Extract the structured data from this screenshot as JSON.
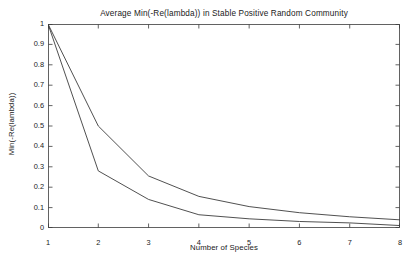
{
  "chart_data": {
    "type": "line",
    "title": "Average Min(-Re(lambda)) in Stable Positive Random Community",
    "xlabel": "Number of Species",
    "ylabel": "Min(-Re(lambda))",
    "xlim": [
      1,
      8
    ],
    "ylim": [
      0,
      1
    ],
    "grid": false,
    "legend": "none",
    "x": [
      1,
      2,
      3,
      4,
      5,
      6,
      7,
      8
    ],
    "xticks": [
      "1",
      "2",
      "3",
      "4",
      "5",
      "6",
      "7",
      "8"
    ],
    "yticks": [
      "0",
      "0.1",
      "0.2",
      "0.3",
      "0.4",
      "0.5",
      "0.6",
      "0.7",
      "0.8",
      "0.9",
      "1"
    ],
    "ytick_values": [
      0,
      0.1,
      0.2,
      0.3,
      0.4,
      0.5,
      0.6,
      0.7,
      0.8,
      0.9,
      1
    ],
    "line_color": "#3c3c3c",
    "background_color": "#ffffff",
    "series": [
      {
        "name": "upper-curve",
        "values": [
          1.0,
          0.5,
          0.255,
          0.155,
          0.105,
          0.075,
          0.055,
          0.04
        ]
      },
      {
        "name": "lower-curve",
        "values": [
          1.0,
          0.28,
          0.14,
          0.065,
          0.045,
          0.032,
          0.025,
          0.012
        ]
      }
    ]
  }
}
